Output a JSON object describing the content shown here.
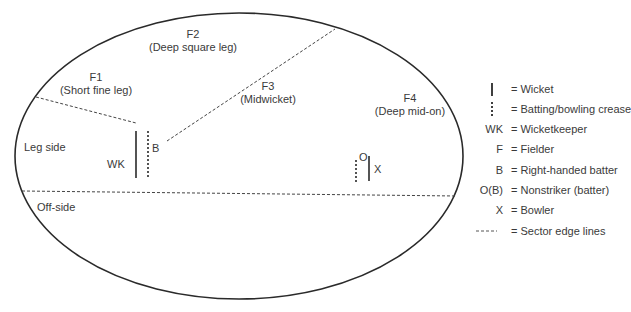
{
  "diagram": {
    "colors": {
      "line": "#2a2a2a",
      "text": "#3a3a3a",
      "background": "#ffffff"
    },
    "field_labels": {
      "leg_side": "Leg side",
      "off_side": "Off-side"
    },
    "fielders": [
      {
        "id": "F1",
        "name": "(Short fine leg)"
      },
      {
        "id": "F2",
        "name": "(Deep square leg)"
      },
      {
        "id": "F3",
        "name": "(Midwicket)"
      },
      {
        "id": "F4",
        "name": "(Deep mid-on)"
      }
    ],
    "players": {
      "wicketkeeper": "WK",
      "batter": "B",
      "nonstriker": "O",
      "bowler": "X"
    },
    "legend": [
      {
        "symbol": "|",
        "symbol_type": "wicket-line",
        "text": "= Wicket"
      },
      {
        "symbol": "¦",
        "symbol_type": "crease-line",
        "text": "= Batting/bowling crease"
      },
      {
        "symbol": "WK",
        "symbol_type": "text",
        "text": "= Wicketkeeper"
      },
      {
        "symbol": "F",
        "symbol_type": "text",
        "text": "= Fielder"
      },
      {
        "symbol": "B",
        "symbol_type": "text",
        "text": "= Right-handed batter"
      },
      {
        "symbol": "O(B)",
        "symbol_type": "text",
        "text": "= Nonstriker (batter)"
      },
      {
        "symbol": "X",
        "symbol_type": "text",
        "text": "= Bowler"
      },
      {
        "symbol": "----",
        "symbol_type": "dash-line",
        "text": "= Sector edge lines"
      }
    ]
  }
}
